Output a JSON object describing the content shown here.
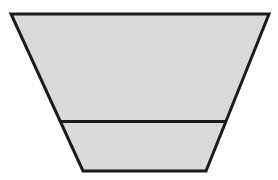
{
  "figure": {
    "trapezoid_points": "11,14 269,14 206,171 83,171",
    "divider_points": "60,121.5 226,121.5",
    "stroke_width": "3"
  },
  "colors": {
    "background": "#ffffff",
    "shape_fill": "#dcdcdc",
    "texture_dot": "#c9c9c9",
    "outline": "#1b1b1b"
  }
}
